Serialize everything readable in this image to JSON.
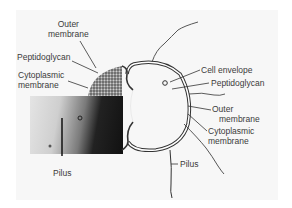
{
  "figure": {
    "left_labels": [
      {
        "id": "outer-membrane",
        "line1": "Outer",
        "line2": "membrane"
      },
      {
        "id": "peptidoglycan",
        "line1": "Peptidoglycan"
      },
      {
        "id": "cytoplasmic-membrane",
        "line1": "Cytoplasmic",
        "line2": "membrane"
      },
      {
        "id": "pilus",
        "line1": "Pilus"
      }
    ],
    "right_labels": [
      {
        "id": "cell-envelope",
        "line1": "Cell envelope"
      },
      {
        "id": "peptidoglycan",
        "line1": "Peptidoglycan"
      },
      {
        "id": "outer-membrane",
        "line1": "Outer",
        "line2": "membrane"
      },
      {
        "id": "cytoplasmic-membrane",
        "line1": "Cytoplasmic",
        "line2": "membrane"
      },
      {
        "id": "pilus",
        "line1": "Pilus"
      }
    ]
  }
}
